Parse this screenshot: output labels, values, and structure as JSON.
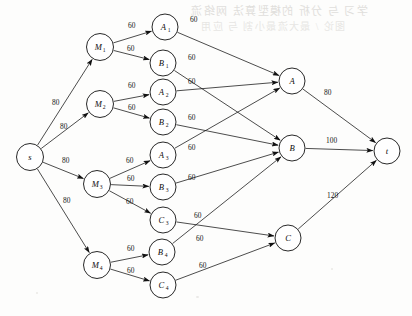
{
  "figure": {
    "width": 412,
    "height": 316,
    "background_color": "#fdfdfc",
    "line_color": "#111111"
  },
  "bleed_through": {
    "line1": "学习 与 分析 的模型算法 网络流",
    "line2": "图论 / 最大流最小割 与 应用"
  },
  "nodes": [
    {
      "id": "s",
      "label": "s",
      "sub": "",
      "cx": 30,
      "cy": 157,
      "r": 13.5
    },
    {
      "id": "M1",
      "label": "M",
      "sub": "1",
      "cx": 100,
      "cy": 47,
      "r": 13.5
    },
    {
      "id": "M2",
      "label": "M",
      "sub": "2",
      "cx": 100,
      "cy": 104,
      "r": 13.5
    },
    {
      "id": "M3",
      "label": "M",
      "sub": "3",
      "cx": 97,
      "cy": 184,
      "r": 13.5
    },
    {
      "id": "M4",
      "label": "M",
      "sub": "4",
      "cx": 97,
      "cy": 265,
      "r": 13.5
    },
    {
      "id": "A1",
      "label": "A",
      "sub": "1",
      "cx": 165,
      "cy": 27,
      "r": 13.0
    },
    {
      "id": "B1",
      "label": "B",
      "sub": "1",
      "cx": 163,
      "cy": 63,
      "r": 13.0
    },
    {
      "id": "A2",
      "label": "A",
      "sub": "2",
      "cx": 163,
      "cy": 92,
      "r": 13.0
    },
    {
      "id": "B2",
      "label": "B",
      "sub": "2",
      "cx": 163,
      "cy": 122,
      "r": 13.0
    },
    {
      "id": "A3",
      "label": "A",
      "sub": "3",
      "cx": 163,
      "cy": 155,
      "r": 13.0
    },
    {
      "id": "B3",
      "label": "B",
      "sub": "3",
      "cx": 163,
      "cy": 187,
      "r": 13.0
    },
    {
      "id": "C3",
      "label": "C",
      "sub": "3",
      "cx": 163,
      "cy": 220,
      "r": 13.0
    },
    {
      "id": "B4",
      "label": "B",
      "sub": "4",
      "cx": 162,
      "cy": 252,
      "r": 13.0
    },
    {
      "id": "C4",
      "label": "C",
      "sub": "4",
      "cx": 163,
      "cy": 285,
      "r": 13.0
    },
    {
      "id": "A",
      "label": "A",
      "sub": "",
      "cx": 292,
      "cy": 81,
      "r": 13.0
    },
    {
      "id": "B",
      "label": "B",
      "sub": "",
      "cx": 292,
      "cy": 148,
      "r": 13.0
    },
    {
      "id": "C",
      "label": "C",
      "sub": "",
      "cx": 288,
      "cy": 238,
      "r": 13.0
    },
    {
      "id": "t",
      "label": "t",
      "sub": "",
      "cx": 387,
      "cy": 151,
      "r": 13.0
    }
  ],
  "edges": [
    {
      "from": "s",
      "to": "M1",
      "capacity": "80",
      "lx": 52,
      "ly": 105
    },
    {
      "from": "s",
      "to": "M2",
      "capacity": "80",
      "lx": 60,
      "ly": 129
    },
    {
      "from": "s",
      "to": "M3",
      "capacity": "80",
      "lx": 62,
      "ly": 163
    },
    {
      "from": "s",
      "to": "M4",
      "capacity": "80",
      "lx": 63,
      "ly": 203
    },
    {
      "from": "M1",
      "to": "A1",
      "capacity": "60",
      "lx": 128,
      "ly": 28
    },
    {
      "from": "M1",
      "to": "B1",
      "capacity": "60",
      "lx": 127,
      "ly": 51
    },
    {
      "from": "M2",
      "to": "A2",
      "capacity": "60",
      "lx": 128,
      "ly": 88
    },
    {
      "from": "M2",
      "to": "B2",
      "capacity": "60",
      "lx": 128,
      "ly": 110
    },
    {
      "from": "M3",
      "to": "A3",
      "capacity": "60",
      "lx": 126,
      "ly": 163
    },
    {
      "from": "M3",
      "to": "B3",
      "capacity": "60",
      "lx": 127,
      "ly": 181
    },
    {
      "from": "M3",
      "to": "C3",
      "capacity": "60",
      "lx": 126,
      "ly": 204
    },
    {
      "from": "M4",
      "to": "B4",
      "capacity": "60",
      "lx": 127,
      "ly": 251
    },
    {
      "from": "M4",
      "to": "C4",
      "capacity": "60",
      "lx": 127,
      "ly": 273
    },
    {
      "from": "A1",
      "to": "A",
      "capacity": "60",
      "lx": 190,
      "ly": 22
    },
    {
      "from": "B1",
      "to": "B",
      "capacity": "60",
      "lx": 188,
      "ly": 60
    },
    {
      "from": "A2",
      "to": "A",
      "capacity": "60",
      "lx": 188,
      "ly": 84
    },
    {
      "from": "B2",
      "to": "B",
      "capacity": "60",
      "lx": 188,
      "ly": 120
    },
    {
      "from": "A3",
      "to": "A",
      "capacity": "60",
      "lx": 188,
      "ly": 150
    },
    {
      "from": "B3",
      "to": "B",
      "capacity": "60",
      "lx": 188,
      "ly": 180
    },
    {
      "from": "C3",
      "to": "C",
      "capacity": "60",
      "lx": 194,
      "ly": 218
    },
    {
      "from": "B4",
      "to": "B",
      "capacity": "60",
      "lx": 196,
      "ly": 241
    },
    {
      "from": "C4",
      "to": "C",
      "capacity": "60",
      "lx": 199,
      "ly": 268
    },
    {
      "from": "A",
      "to": "t",
      "capacity": "80",
      "lx": 324,
      "ly": 95
    },
    {
      "from": "B",
      "to": "t",
      "capacity": "100",
      "lx": 326,
      "ly": 143
    },
    {
      "from": "C",
      "to": "t",
      "capacity": "120",
      "lx": 327,
      "ly": 198
    }
  ]
}
